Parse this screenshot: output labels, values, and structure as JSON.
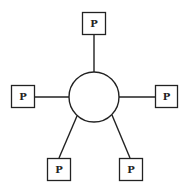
{
  "diagram": {
    "type": "star-topology",
    "hub": {
      "shape": "circle",
      "label": ""
    },
    "nodes": [
      {
        "id": "top",
        "label": "P"
      },
      {
        "id": "left",
        "label": "P"
      },
      {
        "id": "right",
        "label": "P"
      },
      {
        "id": "bottom-left",
        "label": "P"
      },
      {
        "id": "bottom-right",
        "label": "P"
      }
    ],
    "colors": {
      "stroke": "#222222",
      "background": "#ffffff"
    }
  }
}
